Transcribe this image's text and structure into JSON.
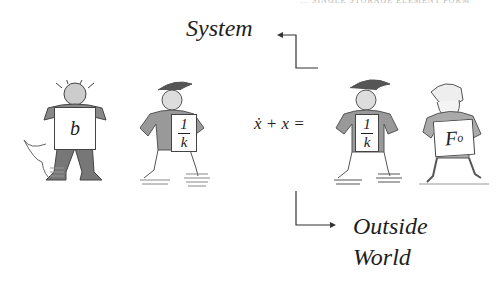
{
  "header": {
    "text": "... SINGLE STORAGE ELEMENT FORM"
  },
  "labels": {
    "system": "System",
    "outside_line1": "Outside",
    "outside_line2": "World"
  },
  "equation": {
    "lhs": "ẋ + x ="
  },
  "figures": [
    {
      "id": "damper",
      "placard": "b",
      "group": "system"
    },
    {
      "id": "spring-left",
      "placard_num": "1",
      "placard_den": "k",
      "group": "system"
    },
    {
      "id": "spring-right",
      "placard_num": "1",
      "placard_den": "k",
      "group": "outside-world"
    },
    {
      "id": "force",
      "placard": "F",
      "placard_sub": "o",
      "group": "outside-world"
    }
  ],
  "colors": {
    "ink": "#1e1e1e",
    "sketch": "#555555",
    "background": "#ffffff"
  }
}
